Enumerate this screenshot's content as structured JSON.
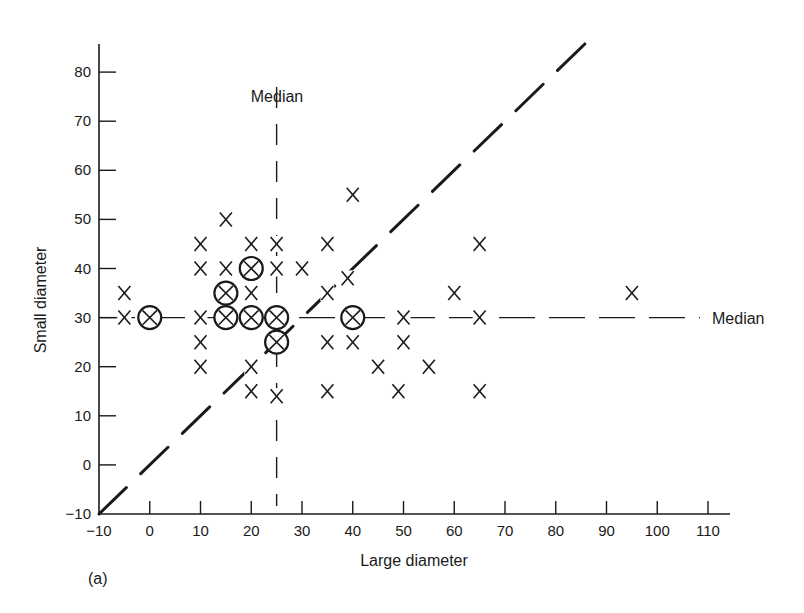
{
  "chart_data": {
    "type": "scatter",
    "panel_label": "(a)",
    "xlabel": "Large diameter",
    "ylabel": "Small diameter",
    "xlim": [
      -10,
      110
    ],
    "ylim": [
      -10,
      85
    ],
    "xticks": [
      -10,
      0,
      10,
      20,
      30,
      40,
      50,
      60,
      70,
      80,
      90,
      100,
      110
    ],
    "yticks": [
      -10,
      0,
      10,
      20,
      30,
      40,
      50,
      60,
      70,
      80
    ],
    "grid": false,
    "legend": null,
    "reference_lines": [
      {
        "name": "vertical-median",
        "type": "vertical",
        "x": 25,
        "style": "dashed",
        "label": "Median",
        "label_position": "top"
      },
      {
        "name": "horizontal-median",
        "type": "horizontal",
        "y": 30,
        "style": "dashed",
        "label": "Median",
        "label_position": "right"
      },
      {
        "name": "identity-line",
        "type": "diagonal",
        "equation": "y = x",
        "style": "dashed",
        "from": [
          -10,
          -10
        ],
        "to": [
          88,
          88
        ]
      }
    ],
    "series": [
      {
        "name": "single",
        "marker": "x",
        "points": [
          [
            -5,
            35
          ],
          [
            -5,
            30
          ],
          [
            10,
            45
          ],
          [
            10,
            40
          ],
          [
            10,
            30
          ],
          [
            10,
            25
          ],
          [
            10,
            20
          ],
          [
            15,
            50
          ],
          [
            15,
            40
          ],
          [
            20,
            45
          ],
          [
            20,
            35
          ],
          [
            20,
            20
          ],
          [
            20,
            15
          ],
          [
            25,
            45
          ],
          [
            25,
            40
          ],
          [
            25,
            14
          ],
          [
            30,
            40
          ],
          [
            35,
            45
          ],
          [
            35,
            35
          ],
          [
            35,
            25
          ],
          [
            35,
            15
          ],
          [
            39,
            38
          ],
          [
            40,
            55
          ],
          [
            40,
            25
          ],
          [
            45,
            20
          ],
          [
            49,
            15
          ],
          [
            50,
            30
          ],
          [
            50,
            25
          ],
          [
            55,
            20
          ],
          [
            60,
            35
          ],
          [
            65,
            45
          ],
          [
            65,
            30
          ],
          [
            65,
            15
          ],
          [
            95,
            35
          ]
        ]
      },
      {
        "name": "circled",
        "marker": "circled-x",
        "points": [
          [
            0,
            30
          ],
          [
            15,
            35
          ],
          [
            15,
            30
          ],
          [
            20,
            40
          ],
          [
            20,
            30
          ],
          [
            25,
            30
          ],
          [
            25,
            25
          ],
          [
            40,
            30
          ]
        ]
      }
    ]
  }
}
